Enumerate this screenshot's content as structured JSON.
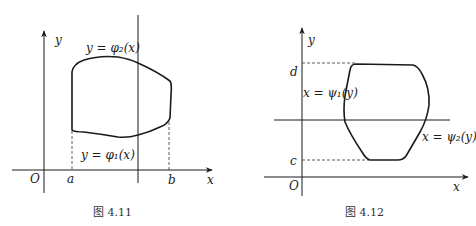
{
  "figures": [
    {
      "caption": "图 4.11",
      "origin_label": "O",
      "x_axis_label": "x",
      "y_axis_label": "y",
      "bounds": {
        "left": "a",
        "right": "b"
      },
      "upper_curve_label": "y = φ₂(x)",
      "lower_curve_label": "y = φ₁(x)"
    },
    {
      "caption": "图 4.12",
      "origin_label": "O",
      "x_axis_label": "x",
      "y_axis_label": "y",
      "bounds": {
        "bottom": "c",
        "top": "d"
      },
      "left_curve_label": "x = ψ₁(y)",
      "right_curve_label": "x = ψ₂(y)"
    }
  ]
}
